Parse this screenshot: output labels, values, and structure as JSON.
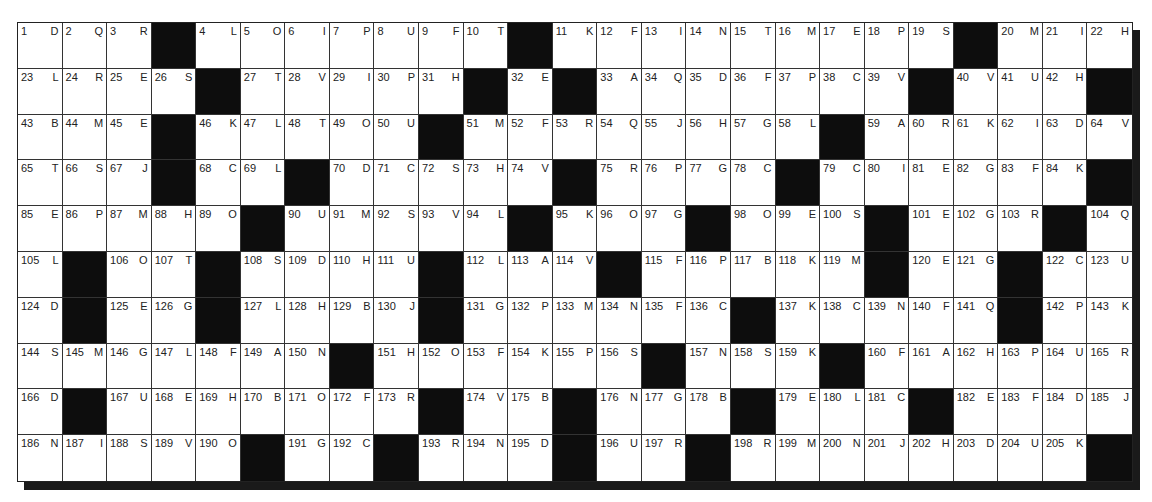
{
  "puzzle": {
    "type": "codeword-grid",
    "columns": 25,
    "rows": 10,
    "colors": {
      "block": "#0d0d0d",
      "cell": "#ffffff",
      "line": "#333333",
      "shadow": "#1a1a1a"
    },
    "grid": [
      [
        [
          "1",
          "D"
        ],
        [
          "2",
          "Q"
        ],
        [
          "3",
          "R"
        ],
        null,
        [
          "4",
          "L"
        ],
        [
          "5",
          "O"
        ],
        [
          "6",
          "I"
        ],
        [
          "7",
          "P"
        ],
        [
          "8",
          "U"
        ],
        [
          "9",
          "F"
        ],
        [
          "10",
          "T"
        ],
        null,
        [
          "11",
          "K"
        ],
        [
          "12",
          "F"
        ],
        [
          "13",
          "I"
        ],
        [
          "14",
          "N"
        ],
        [
          "15",
          "T"
        ],
        [
          "16",
          "M"
        ],
        [
          "17",
          "E"
        ],
        [
          "18",
          "P"
        ],
        [
          "19",
          "S"
        ],
        null,
        [
          "20",
          "M"
        ],
        [
          "21",
          "I"
        ],
        [
          "22",
          "H"
        ]
      ],
      [
        [
          "23",
          "L"
        ],
        [
          "24",
          "R"
        ],
        [
          "25",
          "E"
        ],
        [
          "26",
          "S"
        ],
        null,
        [
          "27",
          "T"
        ],
        [
          "28",
          "V"
        ],
        [
          "29",
          "I"
        ],
        [
          "30",
          "P"
        ],
        [
          "31",
          "H"
        ],
        null,
        [
          "32",
          "E"
        ],
        null,
        [
          "33",
          "A"
        ],
        [
          "34",
          "Q"
        ],
        [
          "35",
          "D"
        ],
        [
          "36",
          "F"
        ],
        [
          "37",
          "P"
        ],
        [
          "38",
          "C"
        ],
        [
          "39",
          "V"
        ],
        null,
        [
          "40",
          "V"
        ],
        [
          "41",
          "U"
        ],
        [
          "42",
          "H"
        ],
        null
      ],
      [
        [
          "43",
          "B"
        ],
        [
          "44",
          "M"
        ],
        [
          "45",
          "E"
        ],
        null,
        [
          "46",
          "K"
        ],
        [
          "47",
          "L"
        ],
        [
          "48",
          "T"
        ],
        [
          "49",
          "O"
        ],
        [
          "50",
          "U"
        ],
        null,
        [
          "51",
          "M"
        ],
        [
          "52",
          "F"
        ],
        [
          "53",
          "R"
        ],
        [
          "54",
          "Q"
        ],
        [
          "55",
          "J"
        ],
        [
          "56",
          "H"
        ],
        [
          "57",
          "G"
        ],
        [
          "58",
          "L"
        ],
        null,
        [
          "59",
          "A"
        ],
        [
          "60",
          "R"
        ],
        [
          "61",
          "K"
        ],
        [
          "62",
          "I"
        ],
        [
          "63",
          "D"
        ],
        [
          "64",
          "V"
        ]
      ],
      [
        [
          "65",
          "T"
        ],
        [
          "66",
          "S"
        ],
        [
          "67",
          "J"
        ],
        null,
        [
          "68",
          "C"
        ],
        [
          "69",
          "L"
        ],
        null,
        [
          "70",
          "D"
        ],
        [
          "71",
          "C"
        ],
        [
          "72",
          "S"
        ],
        [
          "73",
          "H"
        ],
        [
          "74",
          "V"
        ],
        null,
        [
          "75",
          "R"
        ],
        [
          "76",
          "P"
        ],
        [
          "77",
          "G"
        ],
        [
          "78",
          "C"
        ],
        null,
        [
          "79",
          "C"
        ],
        [
          "80",
          "I"
        ],
        [
          "81",
          "E"
        ],
        [
          "82",
          "G"
        ],
        [
          "83",
          "F"
        ],
        [
          "84",
          "K"
        ],
        null
      ],
      [
        [
          "85",
          "E"
        ],
        [
          "86",
          "P"
        ],
        [
          "87",
          "M"
        ],
        [
          "88",
          "H"
        ],
        [
          "89",
          "O"
        ],
        null,
        [
          "90",
          "U"
        ],
        [
          "91",
          "M"
        ],
        [
          "92",
          "S"
        ],
        [
          "93",
          "V"
        ],
        [
          "94",
          "L"
        ],
        null,
        [
          "95",
          "K"
        ],
        [
          "96",
          "O"
        ],
        [
          "97",
          "G"
        ],
        null,
        [
          "98",
          "O"
        ],
        [
          "99",
          "E"
        ],
        [
          "100",
          "S"
        ],
        null,
        [
          "101",
          "E"
        ],
        [
          "102",
          "G"
        ],
        [
          "103",
          "R"
        ],
        null,
        [
          "104",
          "Q"
        ]
      ],
      [
        [
          "105",
          "L"
        ],
        null,
        [
          "106",
          "O"
        ],
        [
          "107",
          "T"
        ],
        null,
        [
          "108",
          "S"
        ],
        [
          "109",
          "D"
        ],
        [
          "110",
          "H"
        ],
        [
          "111",
          "U"
        ],
        null,
        [
          "112",
          "L"
        ],
        [
          "113",
          "A"
        ],
        [
          "114",
          "V"
        ],
        null,
        [
          "115",
          "F"
        ],
        [
          "116",
          "P"
        ],
        [
          "117",
          "B"
        ],
        [
          "118",
          "K"
        ],
        [
          "119",
          "M"
        ],
        null,
        [
          "120",
          "E"
        ],
        [
          "121",
          "G"
        ],
        null,
        [
          "122",
          "C"
        ],
        [
          "123",
          "U"
        ]
      ],
      [
        [
          "124",
          "D"
        ],
        null,
        [
          "125",
          "E"
        ],
        [
          "126",
          "G"
        ],
        null,
        [
          "127",
          "L"
        ],
        [
          "128",
          "H"
        ],
        [
          "129",
          "B"
        ],
        [
          "130",
          "J"
        ],
        null,
        [
          "131",
          "G"
        ],
        [
          "132",
          "P"
        ],
        [
          "133",
          "M"
        ],
        [
          "134",
          "N"
        ],
        [
          "135",
          "F"
        ],
        [
          "136",
          "C"
        ],
        null,
        [
          "137",
          "K"
        ],
        [
          "138",
          "C"
        ],
        [
          "139",
          "N"
        ],
        [
          "140",
          "F"
        ],
        [
          "141",
          "Q"
        ],
        null,
        [
          "142",
          "P"
        ],
        [
          "143",
          "K"
        ]
      ],
      [
        [
          "144",
          "S"
        ],
        [
          "145",
          "M"
        ],
        [
          "146",
          "G"
        ],
        [
          "147",
          "L"
        ],
        [
          "148",
          "F"
        ],
        [
          "149",
          "A"
        ],
        [
          "150",
          "N"
        ],
        null,
        [
          "151",
          "H"
        ],
        [
          "152",
          "O"
        ],
        [
          "153",
          "F"
        ],
        [
          "154",
          "K"
        ],
        [
          "155",
          "P"
        ],
        [
          "156",
          "S"
        ],
        null,
        [
          "157",
          "N"
        ],
        [
          "158",
          "S"
        ],
        [
          "159",
          "K"
        ],
        null,
        [
          "160",
          "F"
        ],
        [
          "161",
          "A"
        ],
        [
          "162",
          "H"
        ],
        [
          "163",
          "P"
        ],
        [
          "164",
          "U"
        ],
        [
          "165",
          "R"
        ]
      ],
      [
        [
          "166",
          "D"
        ],
        null,
        [
          "167",
          "U"
        ],
        [
          "168",
          "E"
        ],
        [
          "169",
          "H"
        ],
        [
          "170",
          "B"
        ],
        [
          "171",
          "O"
        ],
        [
          "172",
          "F"
        ],
        [
          "173",
          "R"
        ],
        null,
        [
          "174",
          "V"
        ],
        [
          "175",
          "B"
        ],
        null,
        [
          "176",
          "N"
        ],
        [
          "177",
          "G"
        ],
        [
          "178",
          "B"
        ],
        null,
        [
          "179",
          "E"
        ],
        [
          "180",
          "L"
        ],
        [
          "181",
          "C"
        ],
        null,
        [
          "182",
          "E"
        ],
        [
          "183",
          "F"
        ],
        [
          "184",
          "D"
        ],
        [
          "185",
          "J"
        ]
      ],
      [
        [
          "186",
          "N"
        ],
        [
          "187",
          "I"
        ],
        [
          "188",
          "S"
        ],
        [
          "189",
          "V"
        ],
        [
          "190",
          "O"
        ],
        null,
        [
          "191",
          "G"
        ],
        [
          "192",
          "C"
        ],
        null,
        [
          "193",
          "R"
        ],
        [
          "194",
          "N"
        ],
        [
          "195",
          "D"
        ],
        null,
        [
          "196",
          "U"
        ],
        [
          "197",
          "R"
        ],
        null,
        [
          "198",
          "R"
        ],
        [
          "199",
          "M"
        ],
        [
          "200",
          "N"
        ],
        [
          "201",
          "J"
        ],
        [
          "202",
          "H"
        ],
        [
          "203",
          "D"
        ],
        [
          "204",
          "U"
        ],
        [
          "205",
          "K"
        ],
        null
      ]
    ]
  }
}
